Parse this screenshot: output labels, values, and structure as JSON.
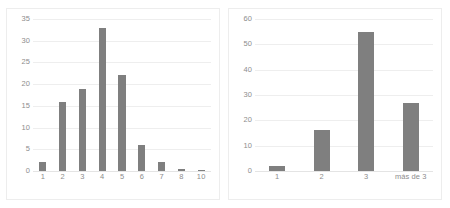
{
  "figure": {
    "background": "#ffffff",
    "bar_color": "#7f7f7f",
    "grid_color": "#eeeeee",
    "tick_color": "#8d8d8d",
    "panel_border_color": "#ededed"
  },
  "chart_data": [
    {
      "type": "bar",
      "id": "left-histogram",
      "title": "",
      "xlabel": "",
      "ylabel": "",
      "categories": [
        "1",
        "2",
        "3",
        "4",
        "5",
        "6",
        "7",
        "8",
        "10"
      ],
      "values": [
        2,
        16,
        19,
        33,
        22,
        6,
        2,
        0.4,
        0.2
      ],
      "ylim": [
        0,
        35
      ],
      "yticks": [
        0,
        5,
        10,
        15,
        20,
        25,
        30,
        35
      ],
      "ytick_labels": [
        "0",
        "5",
        "10",
        "15",
        "20",
        "25",
        "30",
        "35"
      ],
      "grid": true,
      "legend": false
    },
    {
      "type": "bar",
      "id": "right-histogram",
      "title": "",
      "xlabel": "",
      "ylabel": "",
      "categories": [
        "1",
        "2",
        "3",
        "más de 3"
      ],
      "values": [
        2,
        16,
        55,
        27
      ],
      "ylim": [
        0,
        60
      ],
      "yticks": [
        0,
        10,
        20,
        30,
        40,
        50,
        60
      ],
      "ytick_labels": [
        "0",
        "10",
        "20",
        "30",
        "40",
        "50",
        "60"
      ],
      "grid": true,
      "legend": false
    }
  ]
}
